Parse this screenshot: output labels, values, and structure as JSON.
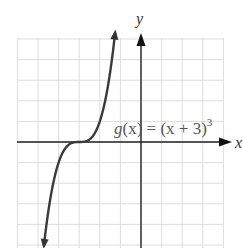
{
  "chart_data": {
    "type": "line",
    "title": "",
    "function": "g(x) = (x + 3)^3",
    "xlabel": "x",
    "ylabel": "y",
    "xlim": [
      -6,
      4
    ],
    "ylim": [
      -5,
      5
    ],
    "grid": true,
    "grid_step": 1,
    "annotation": {
      "text_prefix": "g(x) = (x + 3)",
      "exponent": "3",
      "x": -3.0,
      "y": 0.6
    },
    "series": [
      {
        "name": "g(x)",
        "x": [
          -4.71,
          -4.5,
          -4.25,
          -4.0,
          -3.75,
          -3.5,
          -3.25,
          -3.0,
          -2.75,
          -2.5,
          -2.25,
          -2.0,
          -1.75,
          -1.5,
          -1.26
        ],
        "y": [
          -5.0,
          -3.375,
          -1.953,
          -1.0,
          -0.422,
          -0.125,
          -0.016,
          0.0,
          0.016,
          0.125,
          0.422,
          1.0,
          1.953,
          3.375,
          5.27
        ]
      }
    ],
    "arrows_on_curve_ends": true,
    "colors": {
      "curve": "#333333",
      "axes": "#222222",
      "grid": "#dddddd"
    }
  },
  "labels": {
    "x_axis": "x",
    "y_axis": "y",
    "equation_g": "g",
    "equation_rest": "(x) = (x + 3)",
    "equation_exp": "3"
  },
  "clipped_top_text": "g(x) = (x + 3)³"
}
